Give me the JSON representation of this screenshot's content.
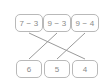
{
  "diagram": {
    "type": "matching-lines",
    "title": "",
    "colors": {
      "box_border": "#b9b9b9",
      "box_fill": "#ffffff",
      "text": "#8a8a8a",
      "line": "#9a9a9a",
      "background": "#ffffff"
    },
    "top_row": [
      {
        "id": "t0",
        "label": "7 − 3",
        "operand_a": 7,
        "operand_b": 3,
        "operator": "−",
        "result": 4
      },
      {
        "id": "t1",
        "label": "9 − 3",
        "operand_a": 9,
        "operand_b": 3,
        "operator": "−",
        "result": 6
      },
      {
        "id": "t2",
        "label": "9 − 4",
        "operand_a": 9,
        "operand_b": 4,
        "operator": "−",
        "result": 5
      }
    ],
    "bottom_row": [
      {
        "id": "b0",
        "label": "6",
        "value": 6
      },
      {
        "id": "b1",
        "label": "5",
        "value": 5
      },
      {
        "id": "b2",
        "label": "4",
        "value": 4
      }
    ],
    "connections": [
      {
        "from": "t0",
        "to": "b2",
        "x1": 29,
        "y1": 33,
        "x2": 85,
        "y2": 59
      },
      {
        "from": "t1",
        "to": "b0",
        "x1": 57,
        "y1": 33,
        "x2": 29,
        "y2": 59
      },
      {
        "from": "t2",
        "to": "b1",
        "x1": 85,
        "y1": 33,
        "x2": 57,
        "y2": 59
      }
    ]
  }
}
